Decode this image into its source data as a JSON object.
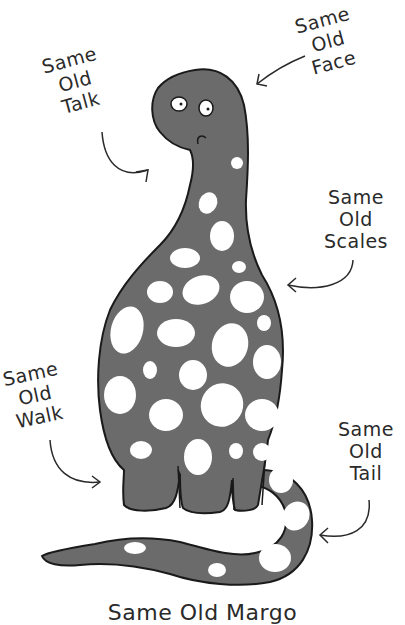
{
  "illustration": {
    "subject": "spotted dinosaur",
    "body_color": "#6b6b6b",
    "outline_color": "#1a1a1a",
    "spot_color": "#ffffff"
  },
  "labels": {
    "talk": {
      "line1": "Same",
      "line2": "Old",
      "line3": "Talk"
    },
    "face": {
      "line1": "Same",
      "line2": "Old",
      "line3": "Face"
    },
    "scales": {
      "line1": "Same",
      "line2": "Old",
      "line3": "Scales"
    },
    "walk": {
      "line1": "Same",
      "line2": "Old",
      "line3": "Walk"
    },
    "tail": {
      "line1": "Same",
      "line2": "Old",
      "line3": "Tail"
    }
  },
  "caption": "Same Old Margo"
}
